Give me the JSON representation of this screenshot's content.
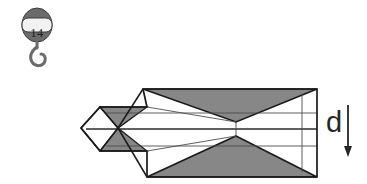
{
  "figure": {
    "background_color": "#ffffff",
    "stroke_color": "#1a1a1a",
    "facet_fill_color": "#878787",
    "thin_line_color": "#4d4d4d"
  },
  "hook_icon": {
    "name": "hook-pulley-icon",
    "label": "14",
    "body_color": "#6b6b6b",
    "plate_color": "#f2f2f2"
  },
  "annotation": {
    "direction_label": "d",
    "arrow": "down-arrow",
    "arrow_color": "#262626"
  },
  "mesh": {
    "description": "faceted elongated solid with shaded triangular facets",
    "outline_points": "81,128 100,107 147,107 143,89 317,89 317,177 147,177 147,151 100,151",
    "left_tip_points": "81,128 100,107 118,128 100,151",
    "shaded_facets": [
      "100,107 147,107 118,128",
      "118,128 147,151 100,151",
      "143,89 317,89 236,122",
      "236,136 317,177 147,177"
    ],
    "grid_lines": [
      {
        "name": "horizontal-line-upper",
        "y": 113
      },
      {
        "name": "horizontal-line-middle",
        "y": 129
      },
      {
        "name": "horizontal-line-lower",
        "y": 146
      },
      {
        "name": "vertical-line-right",
        "x": 302
      },
      {
        "name": "vertical-connector-center",
        "x": 236
      }
    ]
  }
}
